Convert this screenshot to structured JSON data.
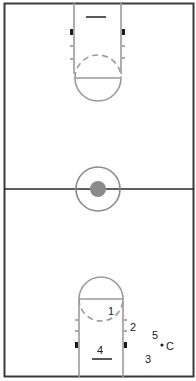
{
  "diagram": {
    "type": "basketball-court-half-court-set",
    "colors": {
      "background": "#ffffff",
      "court_line": "#3a3a3a",
      "lane_line": "#9a9a9a",
      "center_dot": "#8a8a8a",
      "block": "#1a1a1a",
      "text": "#222222"
    },
    "players": [
      {
        "id": "1",
        "label": "1",
        "x": 111,
        "y": 311
      },
      {
        "id": "2",
        "label": "2",
        "x": 133,
        "y": 327
      },
      {
        "id": "3",
        "label": "3",
        "x": 148,
        "y": 359
      },
      {
        "id": "4",
        "label": "4",
        "x": 100,
        "y": 351
      },
      {
        "id": "5",
        "label": "5",
        "x": 155,
        "y": 335
      }
    ],
    "coach": {
      "label": "C",
      "x": 169,
      "y": 349,
      "dot_x": 162,
      "dot_y": 345
    }
  }
}
